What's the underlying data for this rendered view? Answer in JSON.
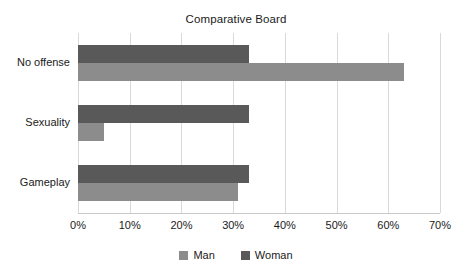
{
  "chart_data": {
    "type": "bar",
    "orientation": "horizontal",
    "title": "Comparative Board",
    "xlabel": "",
    "ylabel": "",
    "categories": [
      "No offense",
      "Sexuality",
      "Gameplay"
    ],
    "series": [
      {
        "name": "Man",
        "color": "#8c8c8c",
        "values": [
          63,
          5,
          31
        ]
      },
      {
        "name": "Woman",
        "color": "#595959",
        "values": [
          33,
          33,
          33
        ]
      }
    ],
    "xlim": [
      0,
      70
    ],
    "xticks": [
      0,
      10,
      20,
      30,
      40,
      50,
      60,
      70
    ],
    "xtick_labels": [
      "0%",
      "10%",
      "20%",
      "30%",
      "40%",
      "50%",
      "60%",
      "70%"
    ],
    "value_suffix": "%",
    "grid": true,
    "grid_axis": "x",
    "legend_position": "bottom",
    "background": "#ffffff",
    "gridline_color": "#d9d9d9"
  }
}
